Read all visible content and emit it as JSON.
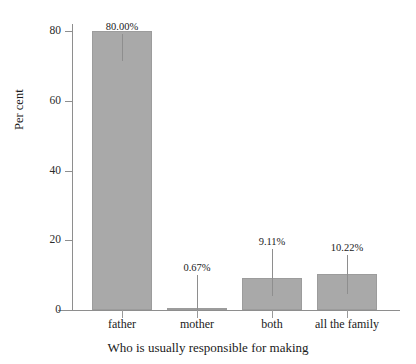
{
  "chart_data": {
    "type": "bar",
    "title": "",
    "xlabel": "Who is usually responsible for making",
    "ylabel": "Per cent",
    "categories": [
      "father",
      "mother",
      "both",
      "all the family"
    ],
    "values": [
      80.0,
      0.67,
      9.11,
      10.22
    ],
    "data_labels": [
      "80.00%",
      "0.67%",
      "9.11%",
      "10.22%"
    ],
    "ylim": [
      0,
      80
    ],
    "yticks": [
      0,
      20,
      40,
      60,
      80
    ],
    "ytick_labels": [
      "0",
      "20",
      "40",
      "60",
      "80"
    ],
    "grid": false,
    "legend": false,
    "bar_color": "#a9a9a9",
    "bar_edge_color": "#9c9c9c",
    "axis_color": "#8e8e8e",
    "background_color": "#ffffff",
    "text_color": "#1a1a1a"
  }
}
